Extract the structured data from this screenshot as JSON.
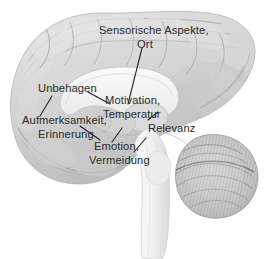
{
  "figure": {
    "name": "mediales-sagittalschnitt-gehirn",
    "background_color": "#ffffff",
    "label_color": "#2b2b2b",
    "leader_color": "#1f1f1f",
    "cortex_color": "#d8d8d8",
    "cortex_shade_color": "#bdbdbd",
    "corpus_callosum_color": "#f4f4f4",
    "brainstem_color": "#f0f0f0",
    "cerebellum_color": "#c9c9c9"
  },
  "labels": {
    "sensory": {
      "line1": "Sensorische Aspekte,",
      "line2": "Ort"
    },
    "discomfort": {
      "line1": "Unbehagen"
    },
    "attention": {
      "line1": "Aufmerksamkeit,",
      "line2": "Erinnerung"
    },
    "motivation": {
      "line1": "Motivation,",
      "line2": "Temperatur"
    },
    "relevance": {
      "line1": "Relevanz"
    },
    "emotion": {
      "line1": "Emotion,",
      "line2": "Vermeidung"
    }
  },
  "structures": {
    "cortex": "cerebral-cortex",
    "corpus_callosum": "corpus-callosum",
    "thalamus": "thalamus",
    "brainstem": "brainstem",
    "cerebellum": "cerebellum",
    "temporal_lobe": "temporal-lobe"
  }
}
